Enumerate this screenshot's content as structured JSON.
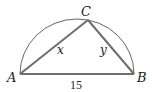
{
  "figure": {
    "type": "semicircle-inscribed-triangle",
    "points": {
      "A": {
        "label": "A",
        "x": 20,
        "y": 74
      },
      "B": {
        "label": "B",
        "x": 134,
        "y": 74
      },
      "C": {
        "label": "C",
        "x": 88,
        "y": 20
      }
    },
    "sides": {
      "AC": {
        "label": "x"
      },
      "BC": {
        "label": "y"
      },
      "AB": {
        "label": "15"
      }
    },
    "colors": {
      "triangle_stroke": "#6e6e6e",
      "arc_stroke": "#555555",
      "text": "#222222"
    }
  }
}
